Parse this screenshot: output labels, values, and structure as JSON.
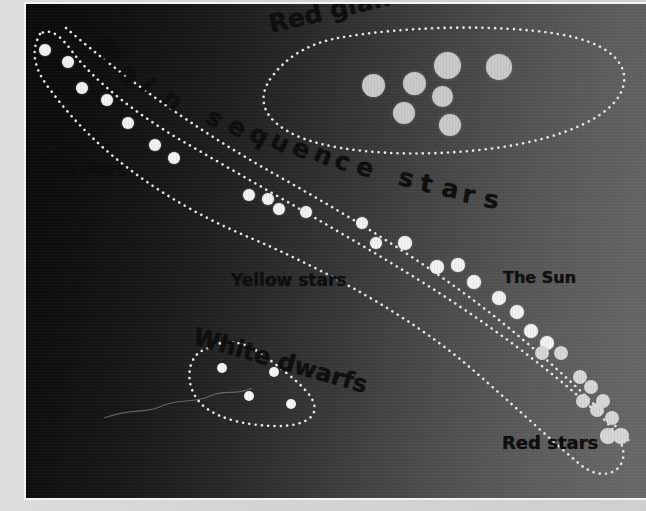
{
  "figure": {
    "side_caption": "increasing brightness",
    "background": {
      "dark_hex": "#0a0a0a",
      "light_hex": "#696969",
      "border_hex": "#f4f4f4"
    }
  },
  "labels": {
    "red_giants": "Red giants",
    "main_sequence": "Main sequence stars",
    "blue_stars": "Blue stars",
    "yellow_stars": "Yellow stars",
    "white_dwarfs": "White dwarfs",
    "the_sun": "The Sun",
    "red_stars": "Red stars"
  },
  "chart_data": {
    "type": "scatter",
    "xlabel": "",
    "ylabel": "increasing brightness",
    "grid": false,
    "legend": "none",
    "annotations": [
      {
        "text": "Red giants",
        "x": 243,
        "y": 6,
        "rotation": -13
      },
      {
        "text": "Main sequence stars",
        "x": 88,
        "y": 40,
        "rotation": 0
      },
      {
        "text": "Blue stars",
        "x": 10,
        "y": 152,
        "rotation": 3
      },
      {
        "text": "Yellow stars",
        "x": 205,
        "y": 266,
        "rotation": 0
      },
      {
        "text": "White dwarfs",
        "x": 168,
        "y": 318,
        "rotation": 16
      },
      {
        "text": "The Sun",
        "x": 477,
        "y": 264,
        "rotation": 0
      },
      {
        "text": "Red stars",
        "x": 476,
        "y": 428,
        "rotation": 0
      }
    ],
    "series": [
      {
        "name": "Main sequence stars",
        "color": "#f2f2f2",
        "points": [
          {
            "x": 19,
            "y": 46,
            "r": 6.0
          },
          {
            "x": 42,
            "y": 58,
            "r": 6.0
          },
          {
            "x": 56,
            "y": 84,
            "r": 6.0
          },
          {
            "x": 81,
            "y": 96,
            "r": 6.0
          },
          {
            "x": 102,
            "y": 119,
            "r": 6.0
          },
          {
            "x": 129,
            "y": 141,
            "r": 6.0
          },
          {
            "x": 148,
            "y": 154,
            "r": 6.0
          },
          {
            "x": 223,
            "y": 191,
            "r": 6.2
          },
          {
            "x": 242,
            "y": 195,
            "r": 6.2
          },
          {
            "x": 253,
            "y": 205,
            "r": 6.2
          },
          {
            "x": 280,
            "y": 208,
            "r": 6.2
          },
          {
            "x": 336,
            "y": 219,
            "r": 6.4
          },
          {
            "x": 350,
            "y": 239,
            "r": 6.4
          },
          {
            "x": 379,
            "y": 239,
            "r": 6.6
          },
          {
            "x": 411,
            "y": 263,
            "r": 6.6
          },
          {
            "x": 432,
            "y": 261,
            "r": 6.6
          },
          {
            "x": 448,
            "y": 278,
            "r": 6.8
          },
          {
            "x": 473,
            "y": 294,
            "r": 6.8
          },
          {
            "x": 491,
            "y": 308,
            "r": 7.0
          },
          {
            "x": 505,
            "y": 327,
            "r": 7.0
          },
          {
            "x": 521,
            "y": 339,
            "r": 7.2
          }
        ]
      },
      {
        "name": "Red stars",
        "color": "#d7d7d7",
        "points": [
          {
            "x": 516,
            "y": 349,
            "r": 7.2
          },
          {
            "x": 535,
            "y": 349,
            "r": 7.2
          },
          {
            "x": 554,
            "y": 373,
            "r": 7.4
          },
          {
            "x": 565,
            "y": 383,
            "r": 7.4
          },
          {
            "x": 557,
            "y": 397,
            "r": 7.4
          },
          {
            "x": 577,
            "y": 397,
            "r": 7.4
          },
          {
            "x": 571,
            "y": 406,
            "r": 7.4
          },
          {
            "x": 586,
            "y": 414,
            "r": 7.4
          },
          {
            "x": 582,
            "y": 432,
            "r": 7.6
          },
          {
            "x": 595,
            "y": 432,
            "r": 7.6
          }
        ]
      },
      {
        "name": "Red giants",
        "color": "#c9c9c9",
        "points": [
          {
            "x": 347,
            "y": 81,
            "r": 11.5
          },
          {
            "x": 388,
            "y": 79,
            "r": 11.5
          },
          {
            "x": 421,
            "y": 61,
            "r": 13.5
          },
          {
            "x": 473,
            "y": 63,
            "r": 13.0
          },
          {
            "x": 416,
            "y": 92,
            "r": 10.5
          },
          {
            "x": 378,
            "y": 109,
            "r": 11.0
          },
          {
            "x": 424,
            "y": 121,
            "r": 11.0
          }
        ]
      },
      {
        "name": "White dwarfs",
        "color": "#f7f7f7",
        "points": [
          {
            "x": 196,
            "y": 364,
            "r": 5.0
          },
          {
            "x": 248,
            "y": 368,
            "r": 5.0
          },
          {
            "x": 223,
            "y": 392,
            "r": 5.0
          },
          {
            "x": 265,
            "y": 400,
            "r": 5.0
          }
        ]
      }
    ],
    "regions": [
      {
        "name": "main-sequence-band",
        "style": "dotted-outline"
      },
      {
        "name": "red-giants-ellipse",
        "style": "dotted-outline"
      },
      {
        "name": "white-dwarfs-blob",
        "style": "dotted-outline"
      }
    ]
  }
}
